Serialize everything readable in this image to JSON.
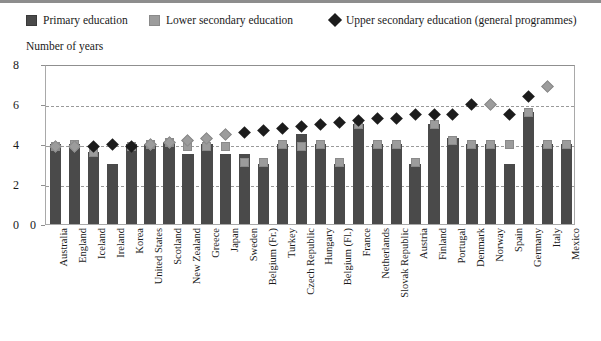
{
  "legend": {
    "items": [
      {
        "label": "Primary education",
        "marker": "square-dark",
        "color": "#4a4a4a"
      },
      {
        "label": "Lower secondary education",
        "marker": "square-light",
        "color": "#9c9c9c"
      },
      {
        "label": "Upper secondary education (general programmes)",
        "marker": "diamond-dark",
        "color": "#1c1c1c"
      }
    ]
  },
  "axis": {
    "y_title": "Number of years",
    "y_ticks": [
      "8",
      "6",
      "4",
      "2",
      "0"
    ]
  },
  "chart_data": {
    "type": "bar",
    "title": "Number of years",
    "xlabel": "",
    "ylabel": "Number of years",
    "ylim": [
      0,
      8
    ],
    "ytick_values": [
      0,
      2,
      4,
      6,
      8
    ],
    "grid": true,
    "legend_position": "top",
    "categories": [
      "Australia",
      "England",
      "Iceland",
      "Ireland",
      "Korea",
      "United States",
      "Scotland",
      "New Zealand",
      "Greece",
      "Japan",
      "Sweden",
      "Belgium (Fr.)",
      "Turkey",
      "Czech Republic",
      "Hungary",
      "Belgium (Fl.)",
      "France",
      "Netherlands",
      "Slovak Republic",
      "Austria",
      "Finland",
      "Portugal",
      "Denmark",
      "Norway",
      "Spain",
      "Germany",
      "Italy",
      "Mexico"
    ],
    "series": [
      {
        "name": "Primary education",
        "marker": "bar",
        "color": "#4a4a4a",
        "values": [
          4.0,
          4.0,
          3.6,
          3.0,
          4.0,
          4.0,
          4.1,
          3.5,
          4.0,
          3.5,
          3.5,
          3.0,
          4.0,
          4.5,
          4.0,
          3.0,
          5.0,
          4.0,
          4.0,
          3.0,
          5.0,
          4.3,
          4.0,
          4.0,
          3.0,
          5.6,
          4.0,
          4.0
        ]
      },
      {
        "name": "Lower secondary education",
        "marker": "square-light",
        "color": "#9c9c9c",
        "values": [
          4.0,
          4.1,
          3.7,
          null,
          4.0,
          4.1,
          4.2,
          4.0,
          4.0,
          4.0,
          3.2,
          3.2,
          4.1,
          4.0,
          4.1,
          3.2,
          5.1,
          4.1,
          4.1,
          3.2,
          5.1,
          4.3,
          4.1,
          4.1,
          4.1,
          5.7,
          4.1,
          4.1
        ]
      },
      {
        "name": "Upper secondary education (general programmes)",
        "marker": "diamond-dark",
        "color": "#1c1c1c",
        "values": [
          4.0,
          4.0,
          4.0,
          4.1,
          4.0,
          4.1,
          4.2,
          4.3,
          4.4,
          4.6,
          4.7,
          4.8,
          4.9,
          5.0,
          5.1,
          5.2,
          5.3,
          5.4,
          5.4,
          5.6,
          5.6,
          5.6,
          6.1,
          6.1,
          5.6,
          6.5,
          7.0,
          null
        ]
      }
    ]
  }
}
